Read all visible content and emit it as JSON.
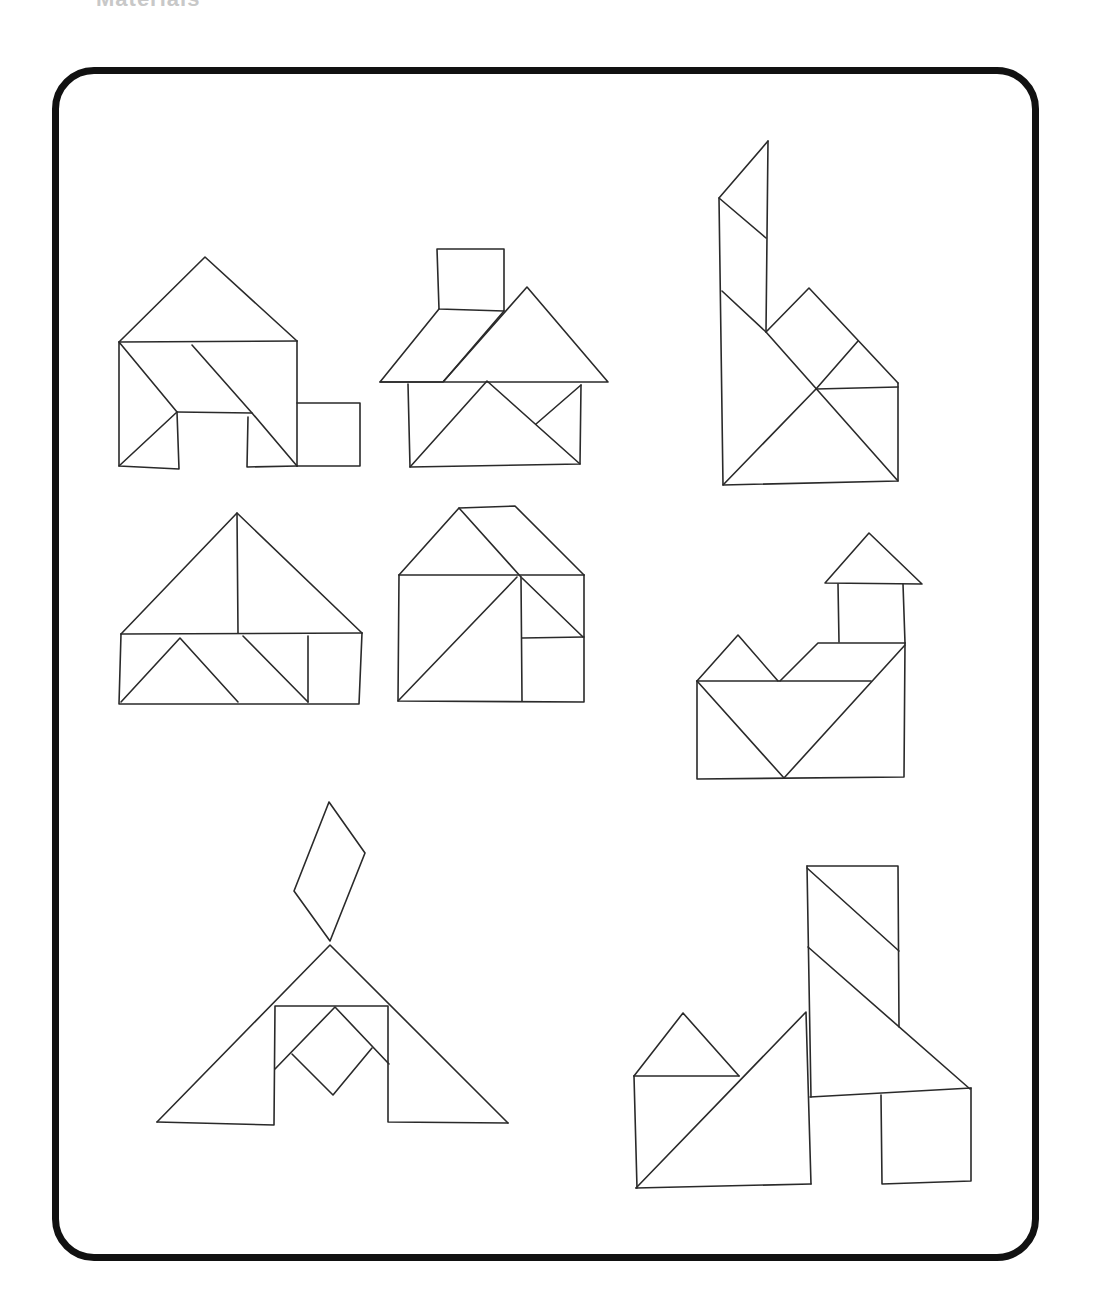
{
  "header": {
    "clipped_title": "Materials"
  },
  "frame": {
    "border_color": "#111111",
    "stroke_color": "#2a2a2a"
  },
  "figures": [
    {
      "name": "house-with-square-shed",
      "segments": [
        [
          [
            119,
            342
          ],
          [
            205,
            257
          ],
          [
            297,
            341
          ]
        ],
        [
          [
            119,
            342
          ],
          [
            297,
            341
          ]
        ],
        [
          [
            119,
            342
          ],
          [
            119,
            466
          ],
          [
            179,
            469
          ],
          [
            177,
            412
          ],
          [
            119,
            342
          ]
        ],
        [
          [
            119,
            466
          ],
          [
            177,
            412
          ]
        ],
        [
          [
            177,
            412
          ],
          [
            252,
            413
          ]
        ],
        [
          [
            192,
            345
          ],
          [
            252,
            413
          ],
          [
            297,
            466
          ]
        ],
        [
          [
            248,
            417
          ],
          [
            247,
            467
          ],
          [
            297,
            466
          ]
        ],
        [
          [
            297,
            341
          ],
          [
            297,
            466
          ]
        ],
        [
          [
            297,
            403
          ],
          [
            360,
            403
          ],
          [
            360,
            466
          ],
          [
            297,
            466
          ]
        ]
      ]
    },
    {
      "name": "house-with-chimney",
      "segments": [
        [
          [
            437,
            249
          ],
          [
            504,
            249
          ],
          [
            504,
            311
          ],
          [
            439,
            309
          ],
          [
            437,
            249
          ]
        ],
        [
          [
            439,
            309
          ],
          [
            380,
            382
          ],
          [
            443,
            382
          ],
          [
            504,
            311
          ]
        ],
        [
          [
            443,
            382
          ],
          [
            527,
            287
          ],
          [
            608,
            382
          ],
          [
            380,
            382
          ]
        ],
        [
          [
            408,
            384
          ],
          [
            410,
            467
          ],
          [
            580,
            464
          ],
          [
            581,
            385
          ]
        ],
        [
          [
            410,
            467
          ],
          [
            487,
            381
          ],
          [
            580,
            464
          ]
        ],
        [
          [
            536,
            424
          ],
          [
            581,
            385
          ]
        ]
      ]
    },
    {
      "name": "tall-tower-figure",
      "segments": [
        [
          [
            768,
            141
          ],
          [
            719,
            198
          ],
          [
            723,
            485
          ],
          [
            898,
            481
          ],
          [
            898,
            383
          ]
        ],
        [
          [
            768,
            141
          ],
          [
            766,
            332
          ]
        ],
        [
          [
            719,
            198
          ],
          [
            766,
            238
          ]
        ],
        [
          [
            722,
            291
          ],
          [
            766,
            332
          ],
          [
            898,
            481
          ]
        ],
        [
          [
            766,
            332
          ],
          [
            809,
            288
          ],
          [
            898,
            383
          ]
        ],
        [
          [
            723,
            485
          ],
          [
            816,
            389
          ],
          [
            858,
            341
          ]
        ],
        [
          [
            816,
            389
          ],
          [
            898,
            387
          ]
        ]
      ]
    },
    {
      "name": "wide-roof-house",
      "segments": [
        [
          [
            121,
            634
          ],
          [
            237,
            513
          ],
          [
            362,
            633
          ]
        ],
        [
          [
            237,
            513
          ],
          [
            238,
            633
          ]
        ],
        [
          [
            121,
            634
          ],
          [
            362,
            633
          ]
        ],
        [
          [
            121,
            634
          ],
          [
            119,
            704
          ],
          [
            359,
            704
          ],
          [
            362,
            633
          ]
        ],
        [
          [
            121,
            702
          ],
          [
            180,
            638
          ],
          [
            238,
            702
          ]
        ],
        [
          [
            243,
            636
          ],
          [
            308,
            702
          ]
        ],
        [
          [
            308,
            636
          ],
          [
            308,
            702
          ]
        ]
      ]
    },
    {
      "name": "square-house",
      "segments": [
        [
          [
            399,
            575
          ],
          [
            459,
            508
          ],
          [
            515,
            506
          ],
          [
            584,
            575
          ]
        ],
        [
          [
            459,
            508
          ],
          [
            521,
            577
          ]
        ],
        [
          [
            399,
            575
          ],
          [
            584,
            575
          ]
        ],
        [
          [
            399,
            575
          ],
          [
            398,
            701
          ],
          [
            584,
            702
          ],
          [
            584,
            575
          ]
        ],
        [
          [
            398,
            701
          ],
          [
            517,
            577
          ]
        ],
        [
          [
            521,
            577
          ],
          [
            522,
            701
          ]
        ],
        [
          [
            522,
            578
          ],
          [
            583,
            637
          ]
        ],
        [
          [
            522,
            638
          ],
          [
            584,
            637
          ]
        ]
      ]
    },
    {
      "name": "house-with-tower",
      "segments": [
        [
          [
            825,
            583
          ],
          [
            869,
            533
          ],
          [
            922,
            584
          ],
          [
            825,
            583
          ]
        ],
        [
          [
            838,
            584
          ],
          [
            839,
            642
          ]
        ],
        [
          [
            903,
            584
          ],
          [
            905,
            643
          ]
        ],
        [
          [
            697,
            681
          ],
          [
            738,
            635
          ],
          [
            778,
            681
          ]
        ],
        [
          [
            780,
            681
          ],
          [
            818,
            643
          ],
          [
            905,
            643
          ]
        ],
        [
          [
            697,
            681
          ],
          [
            871,
            681
          ]
        ],
        [
          [
            697,
            681
          ],
          [
            697,
            779
          ],
          [
            904,
            777
          ],
          [
            905,
            643
          ]
        ],
        [
          [
            697,
            681
          ],
          [
            784,
            778
          ],
          [
            905,
            645
          ]
        ]
      ]
    },
    {
      "name": "tent-with-flag",
      "segments": [
        [
          [
            329,
            802
          ],
          [
            365,
            853
          ],
          [
            330,
            941
          ],
          [
            294,
            891
          ],
          [
            329,
            802
          ]
        ],
        [
          [
            157,
            1122
          ],
          [
            330,
            945
          ],
          [
            508,
            1123
          ]
        ],
        [
          [
            157,
            1122
          ],
          [
            274,
            1125
          ],
          [
            275,
            1006
          ],
          [
            388,
            1006
          ],
          [
            388,
            1122
          ],
          [
            508,
            1123
          ]
        ],
        [
          [
            275,
            1069
          ],
          [
            335,
            1007
          ],
          [
            389,
            1064
          ]
        ],
        [
          [
            292,
            1054
          ],
          [
            333,
            1095
          ],
          [
            372,
            1048
          ]
        ]
      ]
    },
    {
      "name": "factory-with-chimney",
      "segments": [
        [
          [
            807,
            866
          ],
          [
            898,
            866
          ],
          [
            899,
            1027
          ]
        ],
        [
          [
            807,
            868
          ],
          [
            899,
            951
          ]
        ],
        [
          [
            808,
            947
          ],
          [
            970,
            1089
          ]
        ],
        [
          [
            807,
            866
          ],
          [
            811,
            1097
          ]
        ],
        [
          [
            810,
            1097
          ],
          [
            971,
            1088
          ]
        ],
        [
          [
            881,
            1095
          ],
          [
            882,
            1184
          ],
          [
            971,
            1181
          ],
          [
            971,
            1088
          ]
        ],
        [
          [
            634,
            1076
          ],
          [
            683,
            1013
          ],
          [
            739,
            1076
          ]
        ],
        [
          [
            634,
            1076
          ],
          [
            739,
            1076
          ]
        ],
        [
          [
            634,
            1076
          ],
          [
            637,
            1188
          ]
        ],
        [
          [
            636,
            1188
          ],
          [
            806,
            1012
          ],
          [
            811,
            1184
          ]
        ],
        [
          [
            636,
            1188
          ],
          [
            811,
            1184
          ]
        ]
      ]
    }
  ]
}
